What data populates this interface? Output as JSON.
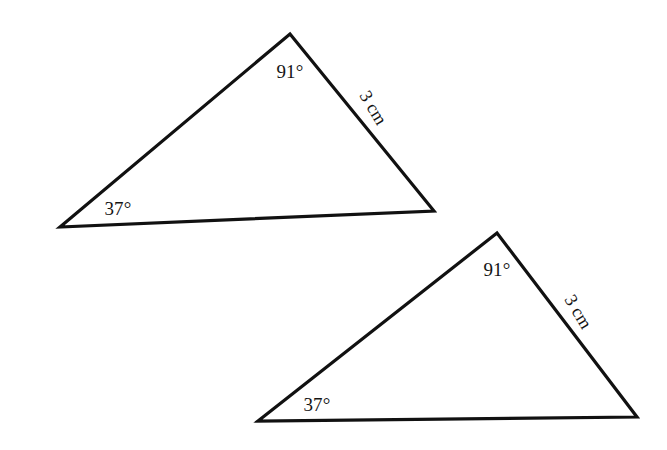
{
  "figure": {
    "type": "congruent-triangles-diagram",
    "background_color": "#ffffff",
    "stroke_color": "#111111",
    "text_color": "#141414",
    "shapes": [
      {
        "name": "triangle-upper-left",
        "vertices": [
          [
            60,
            227
          ],
          [
            290,
            34
          ],
          [
            434,
            211
          ]
        ],
        "labels": {
          "apex_angle": "91°",
          "base_angle": "37°",
          "right_side": "3 cm"
        },
        "label_positions": {
          "apex_angle": [
            290,
            72
          ],
          "base_angle": [
            118,
            209
          ],
          "right_side": [
            373,
            108
          ]
        },
        "side_label_rotation_deg": 59
      },
      {
        "name": "triangle-lower-right",
        "vertices": [
          [
            258,
            421
          ],
          [
            497,
            233
          ],
          [
            637,
            417
          ]
        ],
        "labels": {
          "apex_angle": "91°",
          "base_angle": "37°",
          "right_side": "3 cm"
        },
        "label_positions": {
          "apex_angle": [
            497,
            270
          ],
          "base_angle": [
            317,
            405
          ],
          "right_side": [
            578,
            312
          ]
        },
        "side_label_rotation_deg": 59
      }
    ]
  }
}
